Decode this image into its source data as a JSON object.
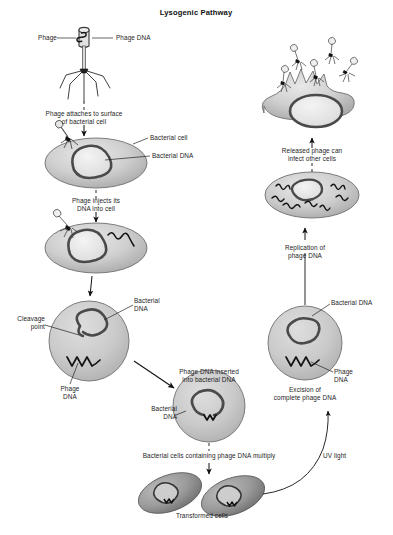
{
  "figure": {
    "title": "Lysogenic Pathway",
    "domain_note": "biology diagram"
  },
  "labels": {
    "phage": "Phage",
    "phage_dna_top": "Phage DNA",
    "attach_step": "Phage attaches to surface\nof bacterial cell",
    "bacterial_cell": "Bacterial cell",
    "bacterial_dna": "Bacterial DNA",
    "inject_step": "Phage injects its\nDNA into cell",
    "cleavage_point": "Cleavage\npoint",
    "bacterial_dna_2": "Bacterial\nDNA",
    "phage_dna_left": "Phage\nDNA",
    "inserted_step": "Phage DNA inserted\ninto bacterial DNA",
    "bacterial_dna_3": "Bacterial\nDNA",
    "multiply_step": "Bacterial cells containing phage DNA multiply",
    "transformed_cells": "Transformed cells",
    "uv_light": "UV light",
    "excision_step": "Excision of\ncomplete phage DNA",
    "phage_dna_right": "Phage\nDNA",
    "bacterial_dna_right": "Bacterial DNA",
    "replication_step": "Replication of\nphage DNA",
    "released_step": "Released phage can\ninfect other cells"
  },
  "colors": {
    "background": "#ffffff",
    "text": "#1d1d1d",
    "cell_fill_light": "#d6d6d6",
    "cell_fill_mid": "#bdbdbd",
    "cell_fill_dark": "#8e8e8e",
    "dna_stroke": "#4a4a4a",
    "phage_dna_stroke": "#151515",
    "outline": "#6f6f6f",
    "arrow": "#111111"
  },
  "nodes": [
    {
      "id": "phage-particle",
      "name": "phage-virion",
      "kind": "phage",
      "x": 84,
      "y": 52
    },
    {
      "id": "cell-attached",
      "name": "bacterial-cell-with-attached-phage",
      "kind": "ellipse-cell",
      "x": 96,
      "y": 160
    },
    {
      "id": "cell-injected",
      "name": "bacterial-cell-dna-injected",
      "kind": "ellipse-cell",
      "x": 96,
      "y": 243
    },
    {
      "id": "cell-cleaved",
      "name": "bacterial-cell-cleavage",
      "kind": "round-cell",
      "x": 89,
      "y": 340
    },
    {
      "id": "cell-inserted",
      "name": "bacterial-cell-phage-dna-inserted",
      "kind": "round-cell",
      "x": 209,
      "y": 406
    },
    {
      "id": "cell-transformed-1",
      "name": "transformed-cell-left",
      "kind": "tilted-cell",
      "x": 170,
      "y": 492
    },
    {
      "id": "cell-transformed-2",
      "name": "transformed-cell-right",
      "kind": "tilted-cell",
      "x": 232,
      "y": 496
    },
    {
      "id": "cell-excision",
      "name": "bacterial-cell-excision",
      "kind": "round-cell",
      "x": 305,
      "y": 343
    },
    {
      "id": "cell-replication",
      "name": "bacterial-cell-phage-replication",
      "kind": "ellipse-cell",
      "x": 312,
      "y": 193
    },
    {
      "id": "cell-lysed",
      "name": "lysed-cell-releasing-phage",
      "kind": "burst-cell",
      "x": 315,
      "y": 95
    }
  ],
  "flow": [
    {
      "from": "phage-particle",
      "to": "cell-attached",
      "label": "Phage attaches to surface of bacterial cell"
    },
    {
      "from": "cell-attached",
      "to": "cell-injected",
      "label": "Phage injects its DNA into cell"
    },
    {
      "from": "cell-injected",
      "to": "cell-cleaved",
      "label": ""
    },
    {
      "from": "cell-cleaved",
      "to": "cell-inserted",
      "label": "Phage DNA inserted into bacterial DNA"
    },
    {
      "from": "cell-inserted",
      "to": "cell-transformed-2",
      "label": "Bacterial cells containing phage DNA multiply"
    },
    {
      "from": "cell-transformed-2",
      "to": "cell-excision",
      "label": "UV light"
    },
    {
      "from": "cell-excision",
      "to": "cell-replication",
      "label": "Replication of phage DNA"
    },
    {
      "from": "cell-replication",
      "to": "cell-lysed",
      "label": "Released phage can infect other cells"
    }
  ]
}
